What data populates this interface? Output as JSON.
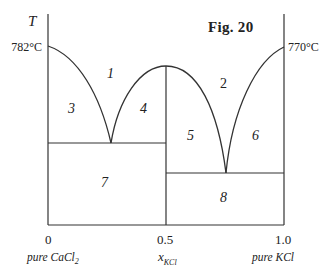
{
  "figure": {
    "title": "Fig. 20",
    "y_axis_label": "T",
    "left_melting_point": "782°C",
    "right_melting_point": "770°C",
    "x_ticks": [
      "0",
      "0.5",
      "1.0"
    ],
    "x_axis_label_main": "x",
    "x_axis_label_sub": "KCl",
    "left_component": "pure CaCl",
    "left_component_sub": "2",
    "right_component": "pure KCl"
  },
  "regions": [
    {
      "id": "1",
      "label": "1"
    },
    {
      "id": "2",
      "label": "2"
    },
    {
      "id": "3",
      "label": "3"
    },
    {
      "id": "4",
      "label": "4"
    },
    {
      "id": "5",
      "label": "5"
    },
    {
      "id": "6",
      "label": "6"
    },
    {
      "id": "7",
      "label": "7"
    },
    {
      "id": "8",
      "label": "8"
    }
  ],
  "colors": {
    "line": "#333333",
    "background": "#ffffff"
  }
}
